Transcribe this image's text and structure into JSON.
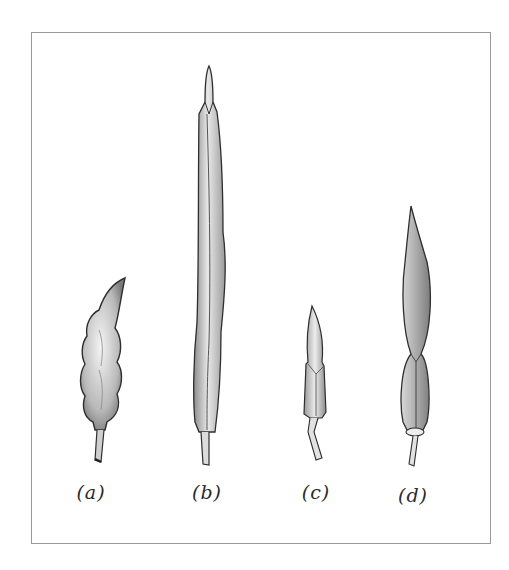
{
  "figure": {
    "frame_color": "#9a9a9a",
    "ink_color": "#3a3a3a",
    "specimens": [
      {
        "id": "a",
        "label": "(a)",
        "description": "plump beaded pod with curved tip and short stalk"
      },
      {
        "id": "b",
        "label": "(b)",
        "description": "long narrow silique"
      },
      {
        "id": "c",
        "label": "(c)",
        "description": "short small pod with stalk"
      },
      {
        "id": "d",
        "label": "(d)",
        "description": "lanceolate pod with pointed tip"
      }
    ]
  }
}
